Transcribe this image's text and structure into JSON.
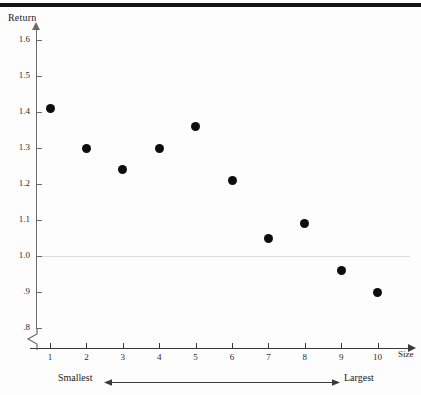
{
  "figure": {
    "top_rule": "horizontal-rule",
    "background_color": "#fdfdfd",
    "marker_color": "#0d0d0d",
    "axis_color": "#3a3a3a",
    "reference_line_color": "#dcdcdc"
  },
  "annotations": {
    "smallest_label": "Smallest",
    "largest_label": "Largest",
    "axis_break_symbol": "axis-break"
  },
  "chart_data": {
    "type": "scatter",
    "title": "",
    "xlabel": "Size",
    "ylabel": "Return",
    "x": [
      1,
      2,
      3,
      4,
      5,
      6,
      7,
      8,
      9,
      10
    ],
    "values": [
      1.41,
      1.3,
      1.24,
      1.3,
      1.36,
      1.21,
      1.05,
      1.09,
      0.96,
      0.9
    ],
    "categories": [
      "1",
      "2",
      "3",
      "4",
      "5",
      "6",
      "7",
      "8",
      "9",
      "10"
    ],
    "xtick_labels": [
      "1",
      "2",
      "3",
      "4",
      "5",
      "6",
      "7",
      "8",
      "9",
      "10"
    ],
    "ytick_labels": [
      "1.6",
      "1.5",
      "1.4",
      "1.3",
      "1.2",
      "1.1",
      "1.0",
      ".9",
      ".8"
    ],
    "ytick_values": [
      1.6,
      1.5,
      1.4,
      1.3,
      1.2,
      1.1,
      1.0,
      0.9,
      0.8
    ],
    "ylim": [
      0.8,
      1.65
    ],
    "xlim": [
      0.5,
      10.5
    ],
    "reference_line_y": 1.0,
    "grid": false,
    "legend": null
  }
}
